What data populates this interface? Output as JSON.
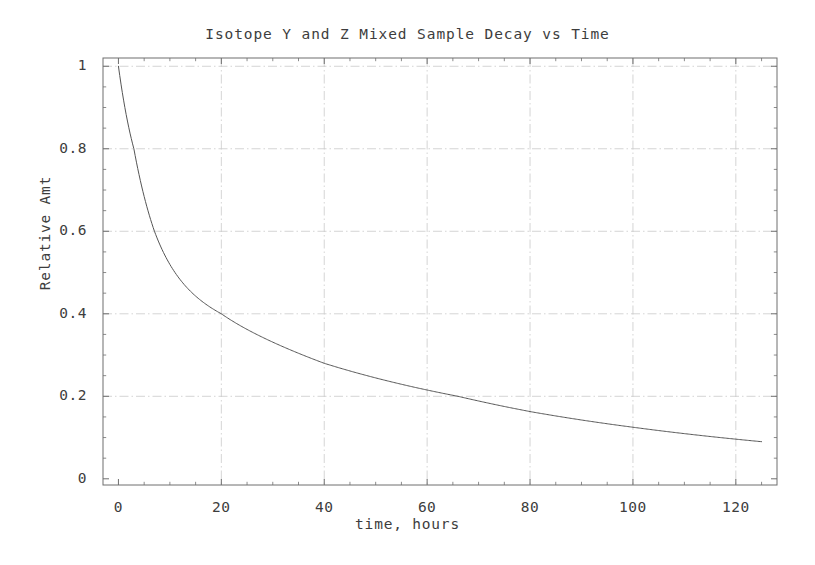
{
  "chart_data": {
    "type": "line",
    "title": "Isotope Y and Z Mixed Sample Decay vs Time",
    "xlabel": "time, hours",
    "ylabel": "Relative Amt",
    "xlim": [
      -3,
      128
    ],
    "ylim": [
      -0.015,
      1.02
    ],
    "grid": true,
    "legend": false,
    "legend_position": "none",
    "line_color": "#555555",
    "x_ticks": [
      0,
      20,
      40,
      60,
      80,
      100,
      120
    ],
    "x_tick_labels": [
      "0",
      "20",
      "40",
      "60",
      "80",
      "100",
      "120"
    ],
    "y_ticks": [
      0,
      0.2,
      0.4,
      0.6,
      0.8,
      1
    ],
    "y_tick_labels": [
      "0",
      "0.2",
      "0.4",
      "0.6",
      "0.8",
      "1"
    ],
    "x_minor_tick_step": 5,
    "y_minor_tick_step": 0.05,
    "series": [
      {
        "name": "Relative Amt",
        "x": [
          0,
          1,
          2,
          3,
          4,
          5,
          6,
          7,
          8,
          9,
          10,
          12,
          14,
          16,
          18,
          20,
          24,
          28,
          32,
          36,
          40,
          45,
          50,
          55,
          60,
          65,
          70,
          75,
          80,
          85,
          90,
          95,
          100,
          105,
          110,
          115,
          120,
          125
        ],
        "y": [
          1.0,
          0.896,
          0.808,
          0.733,
          0.669,
          0.614,
          0.567,
          0.527,
          0.492,
          0.462,
          0.436,
          0.394,
          0.362,
          0.337,
          0.317,
          0.4,
          0.321,
          0.295,
          0.272,
          0.252,
          0.234,
          0.214,
          0.196,
          0.179,
          0.164,
          0.15,
          0.138,
          0.126,
          0.116,
          0.106,
          0.097,
          0.089,
          0.082,
          0.075,
          0.069,
          0.063,
          0.058,
          0.053
        ]
      }
    ],
    "key_points": [
      {
        "x": 0,
        "y": 1.0
      },
      {
        "x": 3,
        "y": 0.8
      },
      {
        "x": 7,
        "y": 0.6
      },
      {
        "x": 20,
        "y": 0.4
      },
      {
        "x": 40,
        "y": 0.28
      },
      {
        "x": 66,
        "y": 0.2
      },
      {
        "x": 80,
        "y": 0.163
      },
      {
        "x": 100,
        "y": 0.125
      },
      {
        "x": 125,
        "y": 0.09
      }
    ],
    "model": "0.55*exp(-t/5.3) + 0.45*exp(-t/56)"
  }
}
